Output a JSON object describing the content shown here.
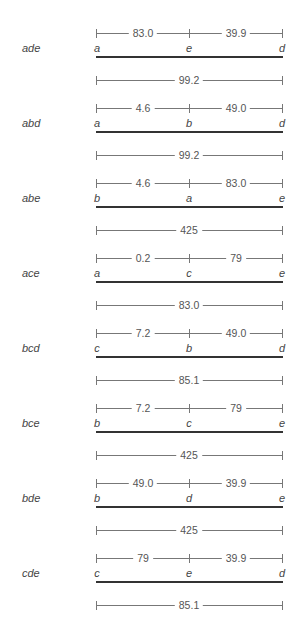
{
  "groups": [
    {
      "label": "ade",
      "points": [
        "a",
        "e",
        "d"
      ],
      "left_seg": "83.0",
      "right_seg": "39.9",
      "total": "99.2"
    },
    {
      "label": "abd",
      "points": [
        "a",
        "b",
        "d"
      ],
      "left_seg": "4.6",
      "right_seg": "49.0",
      "total": "99.2"
    },
    {
      "label": "abe",
      "points": [
        "b",
        "a",
        "e"
      ],
      "left_seg": "4.6",
      "right_seg": "83.0",
      "total": "425"
    },
    {
      "label": "ace",
      "points": [
        "a",
        "c",
        "e"
      ],
      "left_seg": "0.2",
      "right_seg": "79",
      "total": "83.0"
    },
    {
      "label": "bcd",
      "points": [
        "c",
        "b",
        "d"
      ],
      "left_seg": "7.2",
      "right_seg": "49.0",
      "total": "85.1"
    },
    {
      "label": "bce",
      "points": [
        "b",
        "c",
        "e"
      ],
      "left_seg": "7.2",
      "right_seg": "79",
      "total": "425"
    },
    {
      "label": "bde",
      "points": [
        "b",
        "d",
        "e"
      ],
      "left_seg": "49.0",
      "right_seg": "39.9",
      "total": "425"
    },
    {
      "label": "cde",
      "points": [
        "c",
        "e",
        "d"
      ],
      "left_seg": "79",
      "right_seg": "39.9",
      "total": "85.1"
    }
  ]
}
